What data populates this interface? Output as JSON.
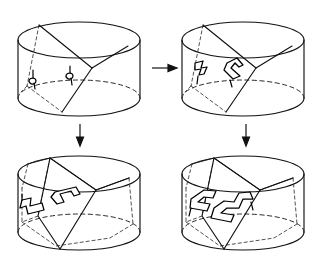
{
  "figure": {
    "background_color": "#ffffff",
    "ink_color": "#111111",
    "panel_count": 4,
    "arrow_count": 3
  },
  "panels": [
    {
      "id": "panel-top-left",
      "position": "top-left",
      "label": "",
      "stage": 1,
      "cylinder": {
        "cx": 79,
        "cy_top": 40,
        "cy_bottom": 98,
        "rx": 61,
        "ry": 18,
        "top_rim": "solid",
        "bottom_rim_front": "solid",
        "bottom_rim_back": "dashed"
      },
      "interior": {
        "diagonal_surface": "single slanted quadrilateral spanning from upper rim to lower rim",
        "hidden_edges": 2,
        "vertical_struts": 0
      },
      "markings": [
        {
          "name": "clasp-small-left",
          "shape": "single-loop",
          "x": 33,
          "y": 74,
          "scale": 1.0
        },
        {
          "name": "clasp-small-right",
          "shape": "single-loop",
          "x": 70,
          "y": 69,
          "scale": 1.0
        }
      ]
    },
    {
      "id": "panel-top-right",
      "position": "top-right",
      "label": "",
      "stage": 2,
      "cylinder": {
        "cx": 243,
        "cy_top": 40,
        "cy_bottom": 98,
        "rx": 61,
        "ry": 18,
        "top_rim": "solid",
        "bottom_rim_front": "solid",
        "bottom_rim_back": "dashed"
      },
      "interior": {
        "diagonal_surface": "single slanted quadrilateral spanning from upper rim to lower rim",
        "hidden_edges": 2,
        "vertical_struts": 0
      },
      "markings": [
        {
          "name": "zigzag-band-left",
          "shape": "double-line-zigzag",
          "x": 198,
          "y": 72,
          "scale": 1.0
        },
        {
          "name": "chevron-band-right",
          "shape": "double-line-chevron",
          "x": 229,
          "y": 72,
          "scale": 1.0
        }
      ]
    },
    {
      "id": "panel-bottom-left",
      "position": "bottom-left",
      "label": "",
      "stage": 3,
      "cylinder": {
        "cx": 79,
        "cy_top": 174,
        "cy_bottom": 232,
        "rx": 61,
        "ry": 18,
        "top_rim": "solid",
        "bottom_rim_front": "solid",
        "bottom_rim_back": "dashed"
      },
      "interior": {
        "diagonal_surface": "slanted quadrilateral with inscribed prism",
        "hidden_edges": 5,
        "vertical_struts": 3
      },
      "markings": [
        {
          "name": "bar-clasp-left",
          "shape": "double-line-bar",
          "x": 33,
          "y": 205,
          "scale": 1.0
        },
        {
          "name": "bar-clasp-right",
          "shape": "double-line-bar",
          "x": 63,
          "y": 196,
          "scale": 1.0
        }
      ]
    },
    {
      "id": "panel-bottom-right",
      "position": "bottom-right",
      "label": "",
      "stage": 4,
      "cylinder": {
        "cx": 243,
        "cy_top": 174,
        "cy_bottom": 232,
        "rx": 61,
        "ry": 18,
        "top_rim": "solid",
        "bottom_rim_front": "solid",
        "bottom_rim_back": "dashed"
      },
      "interior": {
        "diagonal_surface": "slanted quadrilateral with inscribed prism",
        "hidden_edges": 5,
        "vertical_struts": 3
      },
      "markings": [
        {
          "name": "knot-parallelogram-upper",
          "shape": "double-line-parallelogram",
          "x": 198,
          "y": 196,
          "scale": 1.0
        },
        {
          "name": "knot-step-lower",
          "shape": "double-line-step",
          "x": 222,
          "y": 205,
          "scale": 1.0
        }
      ]
    }
  ],
  "arrows": [
    {
      "id": "arrow-right-top",
      "name": "arrow-right",
      "direction": "right",
      "from": "panel-top-left",
      "to": "panel-top-right",
      "x": 152,
      "y": 67,
      "length": 24,
      "label": ""
    },
    {
      "id": "arrow-down-left",
      "name": "arrow-down",
      "direction": "down",
      "from": "panel-top-left",
      "to": "panel-bottom-left",
      "x": 80,
      "y": 126,
      "length": 20,
      "label": ""
    },
    {
      "id": "arrow-down-right",
      "name": "arrow-down",
      "direction": "down",
      "from": "panel-top-right",
      "to": "panel-bottom-right",
      "x": 246,
      "y": 126,
      "length": 20,
      "label": ""
    }
  ]
}
